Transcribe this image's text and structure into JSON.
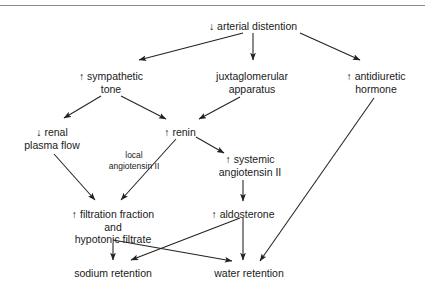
{
  "diagram": {
    "top_rule_color": "#8a8a8a",
    "text_color": "#1a1a1a",
    "arrow_color": "#222222",
    "background": "#ffffff",
    "nodes": [
      {
        "id": "arterial-distention",
        "lines": [
          "↓ arterial distention"
        ],
        "x": 253,
        "y": 20
      },
      {
        "id": "sympathetic-tone",
        "lines": [
          "↑ sympathetic",
          "tone"
        ],
        "x": 111,
        "y": 70
      },
      {
        "id": "juxtaglomerular-apparatus",
        "lines": [
          "juxtaglomerular",
          "apparatus"
        ],
        "x": 252,
        "y": 70
      },
      {
        "id": "antidiuretic-hormone",
        "lines": [
          "↑ antidiuretic",
          "hormone"
        ],
        "x": 376,
        "y": 70
      },
      {
        "id": "renal-plasma-flow",
        "lines": [
          "↓ renal",
          "plasma flow"
        ],
        "x": 52,
        "y": 126
      },
      {
        "id": "renin",
        "lines": [
          "↑ renin"
        ],
        "x": 180,
        "y": 126
      },
      {
        "id": "local-angiotensin-ii",
        "lines": [
          "local",
          "angiotensin II"
        ],
        "x": 134,
        "y": 150,
        "small": true
      },
      {
        "id": "systemic-angiotensin-ii",
        "lines": [
          "↑ systemic",
          "angiotensin II"
        ],
        "x": 250,
        "y": 153
      },
      {
        "id": "filtration-fraction",
        "lines": [
          "↑ filtration fraction",
          "and",
          "hypotonic filtrate"
        ],
        "x": 113,
        "y": 208
      },
      {
        "id": "aldosterone",
        "lines": [
          "↑ aldosterone"
        ],
        "x": 243,
        "y": 208
      },
      {
        "id": "sodium-retention",
        "lines": [
          "sodium retention"
        ],
        "x": 113,
        "y": 267
      },
      {
        "id": "water-retention",
        "lines": [
          "water retention"
        ],
        "x": 249,
        "y": 267
      }
    ],
    "edges": [
      {
        "id": "distention-to-sympathetic",
        "from": "arterial-distention",
        "to": "sympathetic-tone",
        "label": ""
      },
      {
        "id": "distention-to-juxtaglomerular",
        "from": "arterial-distention",
        "to": "juxtaglomerular-apparatus",
        "label": ""
      },
      {
        "id": "distention-to-adh",
        "from": "arterial-distention",
        "to": "antidiuretic-hormone",
        "label": ""
      },
      {
        "id": "sympathetic-to-renal-plasma-flow",
        "from": "sympathetic-tone",
        "to": "renal-plasma-flow",
        "label": ""
      },
      {
        "id": "sympathetic-to-renin",
        "from": "sympathetic-tone",
        "to": "renin",
        "label": ""
      },
      {
        "id": "juxtaglomerular-to-renin",
        "from": "juxtaglomerular-apparatus",
        "to": "renin",
        "label": ""
      },
      {
        "id": "renin-to-local-angiotensin",
        "from": "renin",
        "to": "filtration-fraction",
        "label": "local angiotensin II"
      },
      {
        "id": "renin-to-systemic-angiotensin",
        "from": "renin",
        "to": "systemic-angiotensin-ii",
        "label": ""
      },
      {
        "id": "renal-plasma-flow-to-filtration",
        "from": "renal-plasma-flow",
        "to": "filtration-fraction",
        "label": ""
      },
      {
        "id": "systemic-angiotensin-to-aldosterone",
        "from": "systemic-angiotensin-ii",
        "to": "aldosterone",
        "label": ""
      },
      {
        "id": "filtration-to-sodium-retention",
        "from": "filtration-fraction",
        "to": "sodium-retention",
        "label": ""
      },
      {
        "id": "filtration-to-water-retention",
        "from": "filtration-fraction",
        "to": "water-retention",
        "label": ""
      },
      {
        "id": "aldosterone-to-sodium-retention",
        "from": "aldosterone",
        "to": "sodium-retention",
        "label": ""
      },
      {
        "id": "aldosterone-to-water-retention",
        "from": "aldosterone",
        "to": "water-retention",
        "label": ""
      },
      {
        "id": "adh-to-water-retention",
        "from": "antidiuretic-hormone",
        "to": "water-retention",
        "label": ""
      }
    ]
  }
}
